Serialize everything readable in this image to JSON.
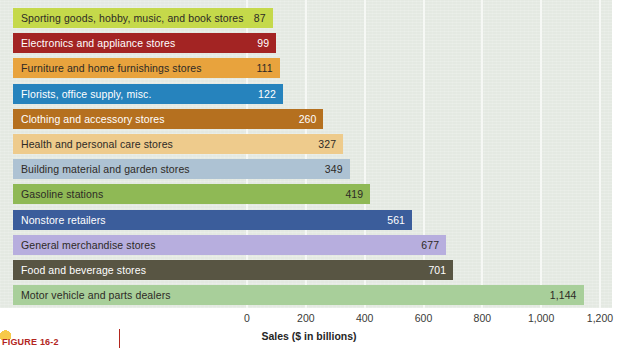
{
  "chart_data": {
    "type": "bar",
    "orientation": "horizontal",
    "title": "",
    "xlabel": "Sales ($ in billions)",
    "ylabel": "",
    "xlim": [
      0,
      1200
    ],
    "xticks": [
      0,
      200,
      400,
      600,
      800,
      1000,
      1200
    ],
    "xtick_labels": [
      "0",
      "200",
      "400",
      "600",
      "800",
      "1,000",
      "1,200"
    ],
    "grid": "vertical",
    "legend": "none",
    "categories": [
      "Sporting goods, hobby, music, and book stores",
      "Electronics and appliance stores",
      "Furniture and home furnishings stores",
      "Florists, office supply, misc.",
      "Clothing and accessory stores",
      "Health and personal care stores",
      "Building material and garden stores",
      "Gasoline stations",
      "Nonstore retailers",
      "General merchandise stores",
      "Food and beverage stores",
      "Motor vehicle and parts dealers"
    ],
    "values": [
      87,
      99,
      111,
      122,
      260,
      327,
      349,
      419,
      561,
      677,
      701,
      1144
    ],
    "value_labels": [
      "87",
      "99",
      "111",
      "122",
      "260",
      "327",
      "349",
      "419",
      "561",
      "677",
      "701",
      "1,144"
    ],
    "bars": [
      {
        "label": "Sporting goods, hobby, music, and book stores",
        "value": 87,
        "value_label": "87",
        "color": "#c5d94a",
        "text": "dark"
      },
      {
        "label": "Electronics and appliance stores",
        "value": 99,
        "value_label": "99",
        "color": "#a32423",
        "text": "light"
      },
      {
        "label": "Furniture and home furnishings stores",
        "value": 111,
        "value_label": "111",
        "color": "#e8a33d",
        "text": "dark"
      },
      {
        "label": "Florists, office supply, misc.",
        "value": 122,
        "value_label": "122",
        "color": "#2683bd",
        "text": "light"
      },
      {
        "label": "Clothing and accessory stores",
        "value": 260,
        "value_label": "260",
        "color": "#b5701f",
        "text": "light"
      },
      {
        "label": "Health and personal care stores",
        "value": 327,
        "value_label": "327",
        "color": "#eecb8c",
        "text": "dark"
      },
      {
        "label": "Building material and garden stores",
        "value": 349,
        "value_label": "349",
        "color": "#adc2d3",
        "text": "dark"
      },
      {
        "label": "Gasoline stations",
        "value": 419,
        "value_label": "419",
        "color": "#8fb955",
        "text": "dark"
      },
      {
        "label": "Nonstore retailers",
        "value": 561,
        "value_label": "561",
        "color": "#3b5d9b",
        "text": "light"
      },
      {
        "label": "General merchandise stores",
        "value": 677,
        "value_label": "677",
        "color": "#b7aede",
        "text": "dark"
      },
      {
        "label": "Food and beverage stores",
        "value": 701,
        "value_label": "701",
        "color": "#585543",
        "text": "light"
      },
      {
        "label": "Motor vehicle and parts dealers",
        "value": 1144,
        "value_label": "1,144",
        "color": "#a8cf9a",
        "text": "dark"
      }
    ]
  },
  "axis": {
    "title": "Sales ($ in billions)",
    "ticks": [
      "0",
      "200",
      "400",
      "600",
      "800",
      "1,000",
      "1,200"
    ]
  },
  "caption": {
    "figure_label": "FIGURE 16-2"
  },
  "colors": {
    "plot_background": "#e4e9e2",
    "gridline": "#f6f8f5",
    "page_background": "#ffffff",
    "caption_accent": "#b3261e"
  }
}
